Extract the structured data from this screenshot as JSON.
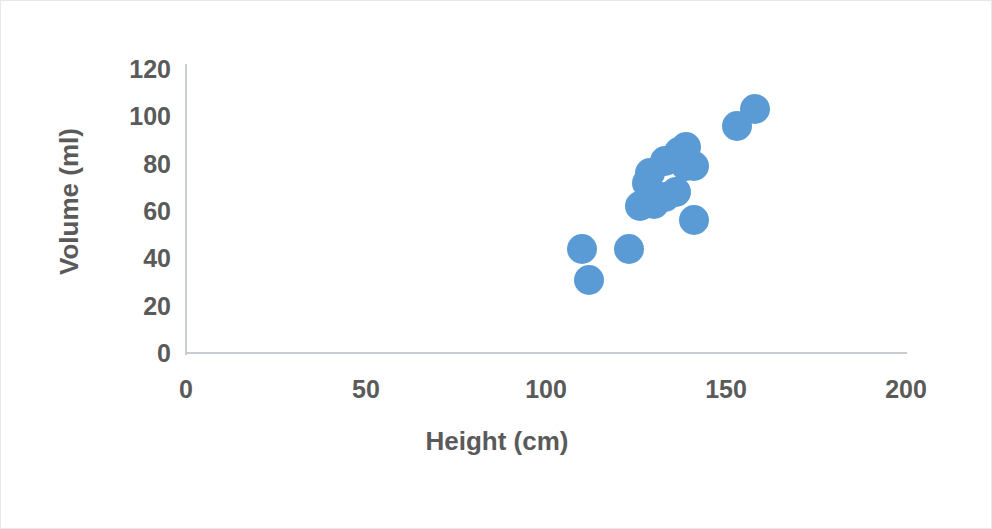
{
  "chart_data": {
    "type": "scatter",
    "title": "",
    "xlabel": "Height (cm)",
    "ylabel": "Volume (ml)",
    "xlim": [
      0,
      200
    ],
    "ylim": [
      0,
      120
    ],
    "xticks": [
      "0",
      "50",
      "100",
      "150",
      "200"
    ],
    "yticks": [
      "0",
      "20",
      "40",
      "60",
      "80",
      "100",
      "120"
    ],
    "grid": false,
    "legend": false,
    "marker_color": "#5B9BD5",
    "marker_size_px": 30,
    "axis_color": "#C9CDD1",
    "text_color": "#5A5A5A",
    "series": [
      {
        "name": "Volume vs Height",
        "points": [
          {
            "x": 110,
            "y": 44
          },
          {
            "x": 112,
            "y": 31
          },
          {
            "x": 123,
            "y": 44
          },
          {
            "x": 141,
            "y": 56
          },
          {
            "x": 126,
            "y": 62
          },
          {
            "x": 130,
            "y": 63
          },
          {
            "x": 133,
            "y": 66
          },
          {
            "x": 136,
            "y": 68
          },
          {
            "x": 128,
            "y": 72
          },
          {
            "x": 129,
            "y": 76
          },
          {
            "x": 139,
            "y": 79
          },
          {
            "x": 141,
            "y": 79
          },
          {
            "x": 133,
            "y": 81
          },
          {
            "x": 137,
            "y": 85
          },
          {
            "x": 139,
            "y": 87
          },
          {
            "x": 153,
            "y": 96
          },
          {
            "x": 158,
            "y": 103
          }
        ]
      }
    ]
  }
}
